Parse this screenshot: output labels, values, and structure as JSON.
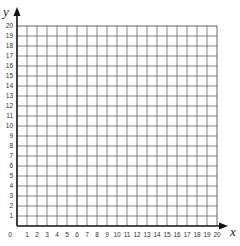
{
  "chart_data": {
    "type": "scatter",
    "title": "",
    "xlabel": "x",
    "ylabel": "y",
    "xlim": [
      0,
      20
    ],
    "ylim": [
      0,
      20
    ],
    "grid": true,
    "x_ticks": [
      "0",
      "1",
      "2",
      "3",
      "4",
      "5",
      "6",
      "7",
      "8",
      "9",
      "10",
      "11",
      "12",
      "13",
      "14",
      "15",
      "16",
      "17",
      "18",
      "19",
      "20"
    ],
    "y_ticks": [
      "1",
      "2",
      "3",
      "4",
      "5",
      "6",
      "7",
      "8",
      "9",
      "10",
      "11",
      "12",
      "13",
      "14",
      "15",
      "16",
      "17",
      "18",
      "19",
      "20"
    ],
    "series": [],
    "colors": {
      "grid": "#555555",
      "axis": "#111111",
      "background": "#ffffff"
    }
  }
}
